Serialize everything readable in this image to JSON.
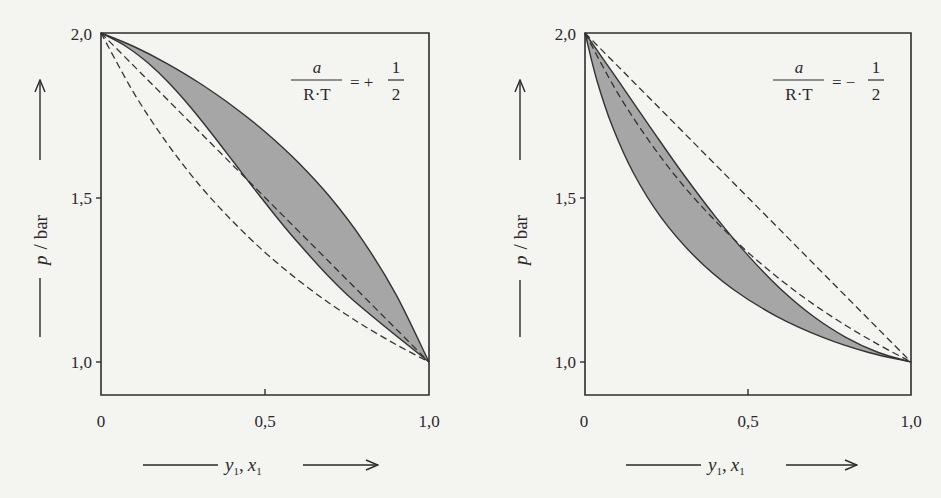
{
  "chart_data": [
    {
      "type": "line",
      "title": "",
      "annotation": {
        "numerator": "a",
        "denominator": "R·T",
        "equals": "= +",
        "frac_num": "1",
        "frac_den": "2",
        "value": 0.5
      },
      "xlabel": "y1, x1",
      "ylabel": "p / bar",
      "xlim": [
        0,
        1
      ],
      "ylim": [
        0.9,
        2.0
      ],
      "xticks": [
        "0",
        "0,5",
        "1,0"
      ],
      "yticks": [
        "1,0",
        "1,5",
        "2,0"
      ],
      "grid": false,
      "x": [
        0,
        0.1,
        0.2,
        0.3,
        0.4,
        0.5,
        0.6,
        0.7,
        0.8,
        0.9,
        1.0
      ],
      "series": [
        {
          "name": "bubble line (real)",
          "style": "solid",
          "values": [
            2.0,
            1.959,
            1.908,
            1.848,
            1.779,
            1.7,
            1.608,
            1.499,
            1.367,
            1.204,
            1.0
          ]
        },
        {
          "name": "dew line (real)",
          "style": "solid",
          "x_values": [
            0,
            0.0765,
            0.1444,
            0.2074,
            0.2692,
            0.3333,
            0.4042,
            0.4885,
            0.597,
            0.7512,
            1.0
          ],
          "values": [
            2.0,
            1.959,
            1.908,
            1.848,
            1.779,
            1.7,
            1.608,
            1.499,
            1.367,
            1.204,
            1.0
          ]
        },
        {
          "name": "bubble line (ideal)",
          "style": "dashed",
          "values": [
            2.0,
            1.9,
            1.8,
            1.7,
            1.6,
            1.5,
            1.4,
            1.3,
            1.2,
            1.1,
            1.0
          ]
        },
        {
          "name": "dew line (ideal)",
          "style": "dashed",
          "values": [
            2.0,
            1.818,
            1.667,
            1.538,
            1.429,
            1.333,
            1.25,
            1.176,
            1.111,
            1.053,
            1.0
          ]
        }
      ],
      "shaded_region": "between real bubble and dew lines",
      "colors": {
        "fill": "#a6a6a6",
        "line": "#333333"
      }
    },
    {
      "type": "line",
      "title": "",
      "annotation": {
        "numerator": "a",
        "denominator": "R·T",
        "equals": "= −",
        "frac_num": "1",
        "frac_den": "2",
        "value": -0.5
      },
      "xlabel": "y1, x1",
      "ylabel": "p / bar",
      "xlim": [
        0,
        1
      ],
      "ylim": [
        0.9,
        2.0
      ],
      "xticks": [
        "0",
        "0,5",
        "1,0"
      ],
      "yticks": [
        "1,0",
        "1,5",
        "2,0"
      ],
      "grid": false,
      "x": [
        0,
        0.1,
        0.2,
        0.3,
        0.4,
        0.5,
        0.6,
        0.7,
        0.8,
        0.9,
        1.0
      ],
      "series": [
        {
          "name": "bubble line (real)",
          "style": "solid",
          "values": [
            2.0,
            1.858,
            1.714,
            1.573,
            1.442,
            1.324,
            1.222,
            1.139,
            1.075,
            1.029,
            1.0
          ]
        },
        {
          "name": "dew line (real)",
          "style": "solid",
          "x_values": [
            0,
            0.0359,
            0.0847,
            0.1493,
            0.2317,
            0.3333,
            0.4532,
            0.5876,
            0.7298,
            0.8703,
            1.0
          ],
          "values": [
            2.0,
            1.858,
            1.714,
            1.573,
            1.442,
            1.324,
            1.222,
            1.139,
            1.075,
            1.029,
            1.0
          ]
        },
        {
          "name": "bubble line (ideal)",
          "style": "dashed",
          "values": [
            2.0,
            1.9,
            1.8,
            1.7,
            1.6,
            1.5,
            1.4,
            1.3,
            1.2,
            1.1,
            1.0
          ]
        },
        {
          "name": "dew line (ideal)",
          "style": "dashed",
          "values": [
            2.0,
            1.818,
            1.667,
            1.538,
            1.429,
            1.333,
            1.25,
            1.176,
            1.111,
            1.053,
            1.0
          ]
        }
      ],
      "shaded_region": "between real bubble and dew lines",
      "colors": {
        "fill": "#a6a6a6",
        "line": "#333333"
      }
    }
  ],
  "labels": {
    "ylabel_italic": "p",
    "ylabel_rest": "/ bar",
    "xlabel_y": "y",
    "xlabel_x": "x",
    "sub": "1",
    "comma": ","
  }
}
